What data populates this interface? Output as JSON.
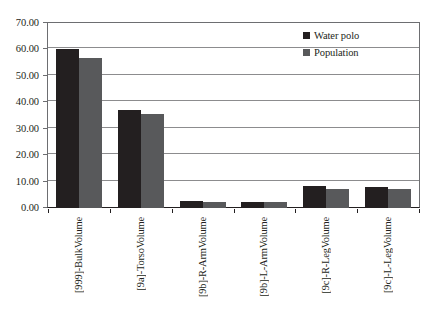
{
  "chart_data": {
    "type": "bar",
    "title": "",
    "subtitle": "",
    "xlabel": "",
    "ylabel": "",
    "ylim": [
      0,
      70
    ],
    "ytick_step": 10,
    "ytick_labels": [
      "0.00",
      "10.00",
      "20.00",
      "30.00",
      "40.00",
      "50.00",
      "60.00",
      "70.00"
    ],
    "ytick_values": [
      0,
      10,
      20,
      30,
      40,
      50,
      60,
      70
    ],
    "grid": true,
    "legend_position": "top-right",
    "categories": [
      "[999]-BulkVolume",
      "[9a]-TorsoVolume",
      "[9b]-R-ArmVolume",
      "[9b]-L-ArmVolume",
      "[9c]-R-LegVolume",
      "[9c]-L-LegVolume"
    ],
    "series": [
      {
        "name": "Water polo",
        "color": "#231f20",
        "values": [
          60.0,
          37.0,
          2.5,
          2.2,
          8.3,
          8.0
        ]
      },
      {
        "name": "Population",
        "color": "#58595b",
        "values": [
          56.6,
          35.7,
          2.2,
          2.1,
          7.3,
          7.2
        ]
      }
    ]
  },
  "legend": {
    "entries": [
      {
        "label": "Water polo",
        "color": "#231f20"
      },
      {
        "label": "Population",
        "color": "#58595b"
      }
    ]
  },
  "colors": {
    "series_water_polo": "#231f20",
    "series_population": "#58595b",
    "gridline": "#8c8c8e",
    "axis": "#231f20",
    "background": "#ffffff"
  }
}
